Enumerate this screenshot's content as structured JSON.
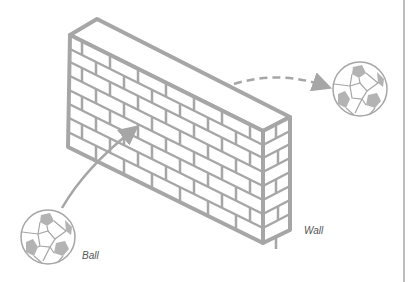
{
  "diagram": {
    "labels": {
      "ball": "Ball",
      "wall": "Wall"
    },
    "elements": [
      {
        "id": "wall",
        "type": "brick-wall",
        "style": "isometric outline"
      },
      {
        "id": "ball-start",
        "type": "soccer-ball"
      },
      {
        "id": "ball-end",
        "type": "soccer-ball"
      },
      {
        "id": "trajectory-in",
        "type": "solid-arrow",
        "from": "ball-start",
        "to": "wall"
      },
      {
        "id": "trajectory-out",
        "type": "dashed-arrow",
        "from": "wall",
        "to": "ball-end"
      }
    ],
    "colors": {
      "stroke": "#a6a6a6",
      "ball_patch": "#b3b3b3",
      "background": "#ffffff",
      "label_text": "#555555"
    }
  }
}
